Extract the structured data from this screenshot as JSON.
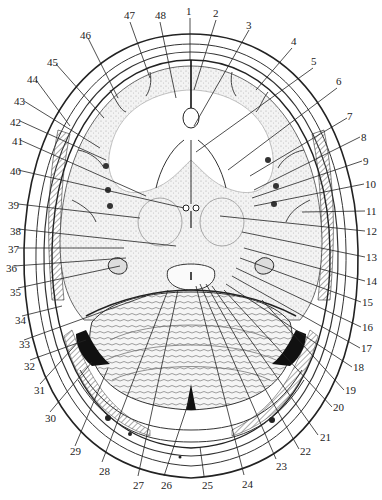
{
  "figure": {
    "type": "anatomical-diagram",
    "colors": {
      "ink": "#222222",
      "stipple": "#bdbdbd",
      "background": "#ffffff",
      "hatch": "#555555",
      "sinus": "#111111"
    }
  },
  "labels": [
    {
      "n": "1",
      "x": 186,
      "y": 6
    },
    {
      "n": "2",
      "x": 213,
      "y": 8
    },
    {
      "n": "3",
      "x": 246,
      "y": 20
    },
    {
      "n": "4",
      "x": 291,
      "y": 36
    },
    {
      "n": "5",
      "x": 311,
      "y": 56
    },
    {
      "n": "6",
      "x": 336,
      "y": 76
    },
    {
      "n": "7",
      "x": 347,
      "y": 111
    },
    {
      "n": "8",
      "x": 361,
      "y": 132
    },
    {
      "n": "9",
      "x": 363,
      "y": 156
    },
    {
      "n": "10",
      "x": 365,
      "y": 179
    },
    {
      "n": "11",
      "x": 366,
      "y": 206
    },
    {
      "n": "12",
      "x": 366,
      "y": 226
    },
    {
      "n": "13",
      "x": 366,
      "y": 252
    },
    {
      "n": "14",
      "x": 366,
      "y": 276
    },
    {
      "n": "15",
      "x": 362,
      "y": 297
    },
    {
      "n": "16",
      "x": 362,
      "y": 322
    },
    {
      "n": "17",
      "x": 361,
      "y": 343
    },
    {
      "n": "18",
      "x": 353,
      "y": 362
    },
    {
      "n": "19",
      "x": 345,
      "y": 385
    },
    {
      "n": "20",
      "x": 333,
      "y": 402
    },
    {
      "n": "21",
      "x": 320,
      "y": 432
    },
    {
      "n": "22",
      "x": 300,
      "y": 446
    },
    {
      "n": "23",
      "x": 276,
      "y": 461
    },
    {
      "n": "24",
      "x": 242,
      "y": 479
    },
    {
      "n": "25",
      "x": 202,
      "y": 480
    },
    {
      "n": "26",
      "x": 161,
      "y": 480
    },
    {
      "n": "27",
      "x": 133,
      "y": 480
    },
    {
      "n": "28",
      "x": 99,
      "y": 466
    },
    {
      "n": "29",
      "x": 70,
      "y": 446
    },
    {
      "n": "30",
      "x": 45,
      "y": 413
    },
    {
      "n": "31",
      "x": 34,
      "y": 385
    },
    {
      "n": "32",
      "x": 24,
      "y": 361
    },
    {
      "n": "33",
      "x": 19,
      "y": 339
    },
    {
      "n": "34",
      "x": 15,
      "y": 315
    },
    {
      "n": "35",
      "x": 10,
      "y": 287
    },
    {
      "n": "36",
      "x": 6,
      "y": 263
    },
    {
      "n": "37",
      "x": 8,
      "y": 244
    },
    {
      "n": "38",
      "x": 10,
      "y": 226
    },
    {
      "n": "39",
      "x": 8,
      "y": 200
    },
    {
      "n": "40",
      "x": 10,
      "y": 166
    },
    {
      "n": "41",
      "x": 12,
      "y": 136
    },
    {
      "n": "42",
      "x": 10,
      "y": 117
    },
    {
      "n": "43",
      "x": 14,
      "y": 96
    },
    {
      "n": "44",
      "x": 27,
      "y": 74
    },
    {
      "n": "45",
      "x": 47,
      "y": 57
    },
    {
      "n": "46",
      "x": 80,
      "y": 30
    },
    {
      "n": "47",
      "x": 124,
      "y": 10
    },
    {
      "n": "48",
      "x": 155,
      "y": 10
    }
  ],
  "leaders": [
    {
      "n": "1",
      "x1": 190,
      "y1": 18,
      "x2": 190,
      "y2": 60
    },
    {
      "n": "2",
      "x1": 216,
      "y1": 20,
      "x2": 194,
      "y2": 90
    },
    {
      "n": "3",
      "x1": 249,
      "y1": 30,
      "x2": 194,
      "y2": 126
    },
    {
      "n": "4",
      "x1": 292,
      "y1": 48,
      "x2": 256,
      "y2": 90
    },
    {
      "n": "5",
      "x1": 313,
      "y1": 68,
      "x2": 196,
      "y2": 152
    },
    {
      "n": "6",
      "x1": 337,
      "y1": 88,
      "x2": 228,
      "y2": 170
    },
    {
      "n": "7",
      "x1": 347,
      "y1": 118,
      "x2": 250,
      "y2": 176
    },
    {
      "n": "8",
      "x1": 360,
      "y1": 137,
      "x2": 254,
      "y2": 190
    },
    {
      "n": "9",
      "x1": 362,
      "y1": 161,
      "x2": 252,
      "y2": 198
    },
    {
      "n": "10",
      "x1": 364,
      "y1": 184,
      "x2": 254,
      "y2": 206
    },
    {
      "n": "11",
      "x1": 365,
      "y1": 211,
      "x2": 302,
      "y2": 212
    },
    {
      "n": "12",
      "x1": 365,
      "y1": 231,
      "x2": 220,
      "y2": 216
    },
    {
      "n": "13",
      "x1": 365,
      "y1": 257,
      "x2": 242,
      "y2": 232
    },
    {
      "n": "14",
      "x1": 365,
      "y1": 281,
      "x2": 244,
      "y2": 248
    },
    {
      "n": "15",
      "x1": 361,
      "y1": 302,
      "x2": 240,
      "y2": 258
    },
    {
      "n": "16",
      "x1": 361,
      "y1": 327,
      "x2": 236,
      "y2": 268
    },
    {
      "n": "17",
      "x1": 360,
      "y1": 348,
      "x2": 232,
      "y2": 276
    },
    {
      "n": "18",
      "x1": 352,
      "y1": 367,
      "x2": 226,
      "y2": 284
    },
    {
      "n": "19",
      "x1": 344,
      "y1": 390,
      "x2": 262,
      "y2": 300
    },
    {
      "n": "20",
      "x1": 332,
      "y1": 407,
      "x2": 224,
      "y2": 290
    },
    {
      "n": "21",
      "x1": 318,
      "y1": 435,
      "x2": 212,
      "y2": 286
    },
    {
      "n": "22",
      "x1": 299,
      "y1": 449,
      "x2": 206,
      "y2": 284
    },
    {
      "n": "23",
      "x1": 276,
      "y1": 459,
      "x2": 200,
      "y2": 284
    },
    {
      "n": "24",
      "x1": 244,
      "y1": 475,
      "x2": 196,
      "y2": 286
    },
    {
      "n": "25",
      "x1": 204,
      "y1": 476,
      "x2": 200,
      "y2": 447
    },
    {
      "n": "26",
      "x1": 164,
      "y1": 476,
      "x2": 190,
      "y2": 398
    },
    {
      "n": "27",
      "x1": 138,
      "y1": 476,
      "x2": 178,
      "y2": 290
    },
    {
      "n": "28",
      "x1": 102,
      "y1": 462,
      "x2": 168,
      "y2": 290
    },
    {
      "n": "29",
      "x1": 75,
      "y1": 446,
      "x2": 108,
      "y2": 368
    },
    {
      "n": "30",
      "x1": 50,
      "y1": 412,
      "x2": 92,
      "y2": 362
    },
    {
      "n": "31",
      "x1": 40,
      "y1": 384,
      "x2": 80,
      "y2": 340
    },
    {
      "n": "32",
      "x1": 30,
      "y1": 360,
      "x2": 86,
      "y2": 340
    },
    {
      "n": "33",
      "x1": 24,
      "y1": 340,
      "x2": 146,
      "y2": 296
    },
    {
      "n": "34",
      "x1": 22,
      "y1": 316,
      "x2": 62,
      "y2": 306
    },
    {
      "n": "35",
      "x1": 18,
      "y1": 288,
      "x2": 120,
      "y2": 266
    },
    {
      "n": "36",
      "x1": 14,
      "y1": 266,
      "x2": 126,
      "y2": 258
    },
    {
      "n": "37",
      "x1": 18,
      "y1": 248,
      "x2": 124,
      "y2": 248
    },
    {
      "n": "38",
      "x1": 18,
      "y1": 229,
      "x2": 176,
      "y2": 246
    },
    {
      "n": "39",
      "x1": 18,
      "y1": 204,
      "x2": 140,
      "y2": 218
    },
    {
      "n": "40",
      "x1": 18,
      "y1": 170,
      "x2": 184,
      "y2": 208
    },
    {
      "n": "41",
      "x1": 20,
      "y1": 140,
      "x2": 146,
      "y2": 196
    },
    {
      "n": "42",
      "x1": 20,
      "y1": 121,
      "x2": 106,
      "y2": 160
    },
    {
      "n": "43",
      "x1": 24,
      "y1": 101,
      "x2": 100,
      "y2": 148
    },
    {
      "n": "44",
      "x1": 36,
      "y1": 80,
      "x2": 70,
      "y2": 126
    },
    {
      "n": "45",
      "x1": 56,
      "y1": 64,
      "x2": 104,
      "y2": 118
    },
    {
      "n": "46",
      "x1": 88,
      "y1": 38,
      "x2": 118,
      "y2": 98
    },
    {
      "n": "47",
      "x1": 130,
      "y1": 22,
      "x2": 150,
      "y2": 78
    },
    {
      "n": "48",
      "x1": 160,
      "y1": 22,
      "x2": 176,
      "y2": 98
    }
  ]
}
